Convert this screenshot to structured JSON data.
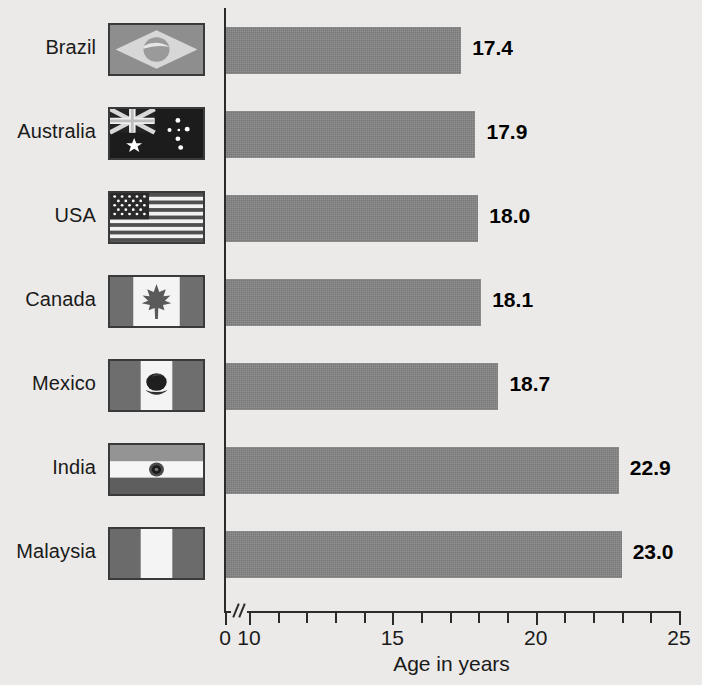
{
  "chart_data": {
    "type": "bar",
    "orientation": "horizontal",
    "title": "",
    "xlabel": "Age in years",
    "ylabel": "",
    "categories": [
      "Brazil",
      "Australia",
      "USA",
      "Canada",
      "Mexico",
      "India",
      "Malaysia"
    ],
    "values": [
      17.4,
      17.9,
      18.0,
      18.1,
      18.7,
      22.9,
      23.0
    ],
    "value_labels": [
      "17.4",
      "17.9",
      "18.0",
      "18.1",
      "18.7",
      "22.9",
      "23.0"
    ],
    "xlim": [
      10,
      25
    ],
    "axis_break": true,
    "axis_break_note": "Axis broken between 0 and 10",
    "xticks_labeled": [
      "0",
      "10",
      "15",
      "20",
      "25"
    ],
    "xtick_minor_step": 1,
    "grid": false,
    "legend": null,
    "bar_color": "#7e7e7e",
    "background_color": "#eceae8",
    "axis_color": "#2b2b2b",
    "text_color": "#1a1a1a"
  },
  "rows": [
    {
      "country": "Brazil",
      "value_label": "17.4",
      "flag": "brazil-flag"
    },
    {
      "country": "Australia",
      "value_label": "17.9",
      "flag": "australia-flag"
    },
    {
      "country": "USA",
      "value_label": "18.0",
      "flag": "usa-flag"
    },
    {
      "country": "Canada",
      "value_label": "18.1",
      "flag": "canada-flag"
    },
    {
      "country": "Mexico",
      "value_label": "18.7",
      "flag": "mexico-flag"
    },
    {
      "country": "India",
      "value_label": "22.9",
      "flag": "india-flag"
    },
    {
      "country": "Malaysia",
      "value_label": "23.0",
      "flag": "malaysia-flag"
    }
  ],
  "axis": {
    "xlabel": "Age in years",
    "ticks": [
      {
        "label": "0",
        "value": 0
      },
      {
        "label": "10",
        "value": 10
      },
      {
        "label": "15",
        "value": 15
      },
      {
        "label": "20",
        "value": 20
      },
      {
        "label": "25",
        "value": 25
      }
    ]
  }
}
